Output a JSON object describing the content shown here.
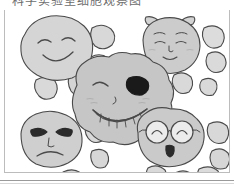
{
  "page": {
    "title_clipped": "科学实验室细胞观察图",
    "background_color": "#ffffff",
    "border_color": "#bcbcbc"
  },
  "illustration": {
    "name": "cartoon-cell-faces-illustration",
    "description": "Hand drawn black-and-white illustration of five large blob shaped cells with cartoon faces surrounded by many small plain blobs",
    "stroke_color": "#4a4a4a",
    "blob_fill_light": "#dcdcdc",
    "blob_fill_mid": "#cfcfcf",
    "blob_fill_dark": "#c2c2c2",
    "blush_color": "#bdbdbd",
    "patch_color": "#1a1a1a",
    "faces": [
      {
        "id": "face-smiling-top-left",
        "label": "smiling face",
        "expression": "happy-closed-eyes",
        "cx": 52,
        "cy": 40,
        "rx": 36,
        "ry": 31,
        "fill": "#d5d5d5",
        "features": [
          "curved-closed-left-eye",
          "curved-closed-right-eye",
          "wide-smile"
        ]
      },
      {
        "id": "face-bow-top-right",
        "label": "face with hair bows",
        "expression": "content-smile",
        "cx": 167,
        "cy": 36,
        "rx": 29,
        "ry": 28,
        "fill": "#cccccc",
        "features": [
          "left-bow",
          "right-bow",
          "eyebrows",
          "closed-eyes",
          "small-nose",
          "small-smile",
          "blush"
        ]
      },
      {
        "id": "face-eyepatch-center",
        "label": "grinning face with eye patch",
        "expression": "mischievous-grin",
        "cx": 117,
        "cy": 91,
        "rx": 48,
        "ry": 44,
        "fill": "#c6c6c6",
        "features": [
          "winking-left-eye",
          "black-eye-patch-right-eye",
          "blush",
          "wide-toothy-grin",
          "teeth"
        ]
      },
      {
        "id": "face-angry-bottom-left",
        "label": "angry face",
        "expression": "annoyed-frown",
        "cx": 49,
        "cy": 134,
        "rx": 33,
        "ry": 29,
        "fill": "#cfcfcf",
        "features": [
          "angled-angry-eyebrow-eyes",
          "dark-pupils",
          "frown-mouth"
        ]
      },
      {
        "id": "face-glasses-bottom-right",
        "label": "face with round glasses",
        "expression": "surprised-nerdy",
        "cx": 167,
        "cy": 133,
        "rx": 35,
        "ry": 30,
        "fill": "#cacaca",
        "features": [
          "round-glasses",
          "bridge",
          "curved-eyes",
          "small-oval-open-mouth"
        ]
      }
    ],
    "small_blobs": [
      {
        "cx": 98,
        "cy": 27,
        "r": 13,
        "fill": "#d8d8d8"
      },
      {
        "cx": 95,
        "cy": 55,
        "r": 11,
        "fill": "#dadada"
      },
      {
        "cx": 41,
        "cy": 79,
        "r": 12,
        "fill": "#d9d9d9"
      },
      {
        "cx": 75,
        "cy": 74,
        "r": 12,
        "fill": "#d4d4d4"
      },
      {
        "cx": 178,
        "cy": 74,
        "r": 11,
        "fill": "#d9d9d9"
      },
      {
        "cx": 209,
        "cy": 28,
        "r": 12,
        "fill": "#dcdcdc"
      },
      {
        "cx": 212,
        "cy": 53,
        "r": 11,
        "fill": "#dadada"
      },
      {
        "cx": 205,
        "cy": 77,
        "r": 9,
        "fill": "#d9d9d9"
      },
      {
        "cx": 91,
        "cy": 123,
        "r": 11,
        "fill": "#d9d9d9"
      },
      {
        "cx": 95,
        "cy": 150,
        "r": 10,
        "fill": "#d7d7d7"
      },
      {
        "cx": 214,
        "cy": 124,
        "r": 12,
        "fill": "#d8d8d8"
      },
      {
        "cx": 216,
        "cy": 150,
        "r": 11,
        "fill": "#d6d6d6"
      },
      {
        "cx": 37,
        "cy": 175,
        "r": 11,
        "fill": "#d2d2d2"
      },
      {
        "cx": 68,
        "cy": 172,
        "r": 12,
        "fill": "#d8d8d8"
      },
      {
        "cx": 152,
        "cy": 167,
        "r": 11,
        "fill": "#d9d9d9"
      },
      {
        "cx": 180,
        "cy": 172,
        "r": 11,
        "fill": "#d6d6d6"
      },
      {
        "cx": 204,
        "cy": 168,
        "r": 12,
        "fill": "#dbdbdb"
      }
    ]
  }
}
